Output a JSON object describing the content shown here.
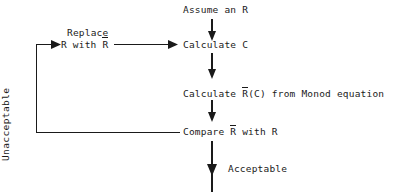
{
  "diagram": {
    "type": "flowchart",
    "background_color": "#ffffff",
    "line_color": "#1a1a1a",
    "text_color": "#1a1a1a",
    "nodes": {
      "assume": "Assume an R",
      "replace_line1": "Replace",
      "replace_line2_pre": "R with ",
      "replace_line2_bar": "R",
      "calculate_c": "Calculate C",
      "calculate_r_pre": "Calculate ",
      "calculate_r_bar": "R",
      "calculate_r_post": "(C) from Monod equation",
      "compare_pre": "Compare ",
      "compare_bar": "R",
      "compare_post": " with R"
    },
    "edge_labels": {
      "unacceptable": "Unacceptable",
      "acceptable": "Acceptable"
    }
  }
}
